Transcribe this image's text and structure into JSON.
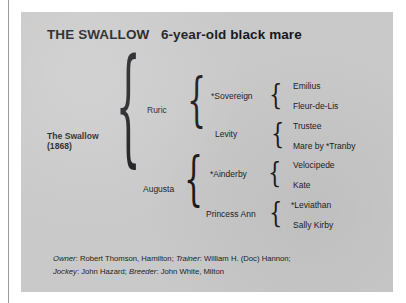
{
  "panel": {
    "title": "THE SWALLOW   6-year-old black mare",
    "background_color": "#c9c9c9",
    "text_color": "#1d1d20"
  },
  "pedigree": {
    "subject": {
      "name": "The Swallow",
      "year": "(1868)"
    },
    "generation_2": [
      {
        "name": "Ruric"
      },
      {
        "name": "Augusta"
      }
    ],
    "generation_3": [
      {
        "name": "*Sovereign"
      },
      {
        "name": "Levity"
      },
      {
        "name": "*Ainderby"
      },
      {
        "name": "Princess Ann"
      }
    ],
    "generation_4": [
      {
        "name": "Emilius"
      },
      {
        "name": "Fleur-de-Lis"
      },
      {
        "name": "Trustee"
      },
      {
        "name": "Mare by *Tranby"
      },
      {
        "name": "Velocipede"
      },
      {
        "name": "Kate"
      },
      {
        "name": "*Leviathan"
      },
      {
        "name": "Sally Kirby"
      }
    ],
    "brace_glyph": "{"
  },
  "credits": {
    "line1": {
      "owner_label": "Owner",
      "owner_value": ": Robert Thomson, Hamilton; ",
      "trainer_label": "Trainer",
      "trainer_value": ": William H. (Doc) Hannon;"
    },
    "line2": {
      "jockey_label": "Jockey",
      "jockey_value": ": John Hazard; ",
      "breeder_label": "Breeder",
      "breeder_value": ": John White, Milton"
    }
  }
}
